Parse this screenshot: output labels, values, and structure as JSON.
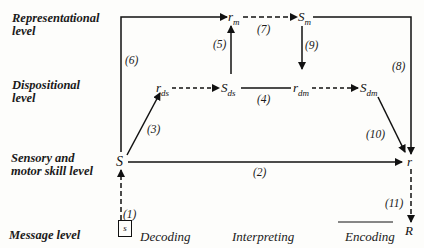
{
  "levels": {
    "representational": [
      "Representational",
      "level"
    ],
    "dispositional": [
      "Dispositional",
      "level"
    ],
    "sensory": [
      "Sensory and",
      "motor skill level"
    ],
    "message": "Message level"
  },
  "nodes": {
    "r_m": {
      "base": "r",
      "sub": "m"
    },
    "S_m": {
      "base": "S",
      "sub": "m"
    },
    "r_ds": {
      "base": "r",
      "sub": "ds"
    },
    "S_ds": {
      "base": "S",
      "sub": "ds"
    },
    "r_dm": {
      "base": "r",
      "sub": "dm"
    },
    "S_dm": {
      "base": "S",
      "sub": "dm"
    },
    "S": "S",
    "r": "r",
    "R": "R",
    "s": "s"
  },
  "paths": {
    "p1": "(1)",
    "p2": "(2)",
    "p3": "(3)",
    "p4": "(4)",
    "p5": "(5)",
    "p6": "(6)",
    "p7": "(7)",
    "p8": "(8)",
    "p9": "(9)",
    "p10": "(10)",
    "p11": "(11)"
  },
  "processes": {
    "decoding": "Decoding",
    "interpreting": "Interpreting",
    "encoding": "Encoding"
  }
}
